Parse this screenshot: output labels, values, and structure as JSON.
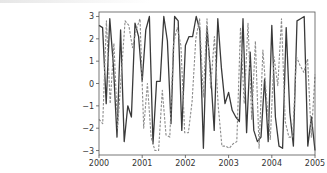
{
  "chart_data": {
    "type": "line",
    "title": "",
    "xlabel": "",
    "ylabel": "",
    "xlim": [
      2000,
      2005
    ],
    "ylim": [
      -3.2,
      3.2
    ],
    "grid": false,
    "legend": null,
    "x_ticks": [
      "2000",
      "2001",
      "2002",
      "2003",
      "2004",
      "2005"
    ],
    "y_ticks": [
      "3",
      "2",
      "1",
      "0",
      "−1",
      "−2",
      "−3"
    ],
    "x_tick_values": [
      2000,
      2001,
      2002,
      2003,
      2004,
      2005
    ],
    "y_tick_values": [
      3,
      2,
      1,
      0,
      -1,
      -2,
      -3
    ],
    "series": [
      {
        "name": "solid",
        "style": "solid",
        "color": "#3a3a3a",
        "values": [
          2.6,
          2.5,
          -0.9,
          2.9,
          0.8,
          -2.4,
          2.4,
          -2.6,
          -1.0,
          -1.5,
          2.7,
          2.1,
          0.1,
          2.4,
          3.0,
          -2.7,
          0.1,
          0.1,
          3.0,
          1.9,
          -1.8,
          3.0,
          2.8,
          -2.1,
          1.7,
          2.1,
          2.1,
          3.0,
          2.4,
          -2.9,
          2.5,
          0.5,
          -2.1,
          2.9,
          0.7,
          -0.9,
          -0.4,
          -1.2,
          -1.5,
          -1.7,
          2.9,
          -2.2,
          1.4,
          -2.1,
          -2.6,
          -2.4,
          0.2,
          -2.6,
          2.6,
          -1.5,
          -2.8,
          -2.9,
          2.5,
          -1.3,
          -2.8,
          2.8,
          2.9,
          3.0,
          -2.8,
          -1.5,
          -3.0
        ]
      },
      {
        "name": "dashed",
        "style": "dashed",
        "color": "#8c8c8c",
        "values": [
          -1.6,
          -1.8,
          2.8,
          -0.9,
          1.8,
          -2.0,
          0.4,
          2.8,
          2.6,
          1.6,
          2.4,
          2.9,
          -2.0,
          0.0,
          -2.4,
          -3.0,
          -3.0,
          -0.3,
          -2.3,
          -2.4,
          1.8,
          2.5,
          1.7,
          -2.2,
          -2.2,
          -0.8,
          2.0,
          2.9,
          -0.6,
          2.9,
          -0.2,
          2.1,
          -1.0,
          -2.8,
          -2.8,
          -2.9,
          -2.7,
          -2.6,
          2.5,
          -0.9,
          2.7,
          -1.6,
          1.9,
          -2.9,
          1.5,
          -0.7,
          -2.5,
          1.2,
          -0.1,
          2.9,
          -1.7,
          -2.4,
          -2.4,
          1.2,
          0.8,
          0.5,
          1.1,
          -2.4,
          0.4
        ]
      }
    ]
  }
}
